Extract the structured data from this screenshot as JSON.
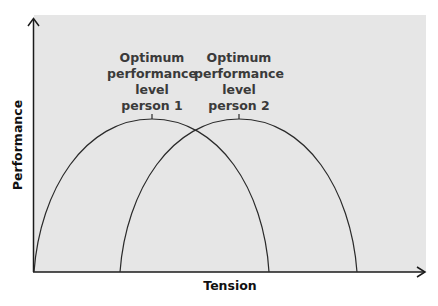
{
  "diagram": {
    "type": "inverted-U performance curves",
    "background_color": "#e6e6e6",
    "line_color": "#2a2a2a",
    "x_axis": {
      "label": "Tension"
    },
    "y_axis": {
      "label": "Performance"
    },
    "curves": [
      {
        "name": "person 1",
        "label_lines": [
          "Optimum",
          "performance",
          "level",
          "person 1"
        ]
      },
      {
        "name": "person 2",
        "label_lines": [
          "Optimum",
          "performance",
          "level",
          "person 2"
        ]
      }
    ]
  }
}
